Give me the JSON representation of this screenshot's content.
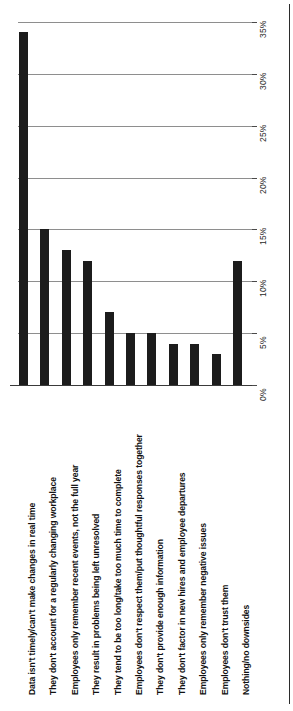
{
  "chart_data": {
    "type": "bar",
    "title": "",
    "subtitle": "",
    "xlabel": "",
    "ylabel": "",
    "orientation": "vertical-bars-rotated-labels",
    "grid": true,
    "legend": false,
    "ylim": [
      0,
      35
    ],
    "ytick_labels": [
      "0%",
      "5%",
      "10%",
      "15%",
      "20%",
      "25%",
      "30%",
      "35%"
    ],
    "ytick_values": [
      0,
      5,
      10,
      15,
      20,
      25,
      30,
      35
    ],
    "categories": [
      "Data isn't timely/can't make changes in real time",
      "They don't account for a regularly changing workplace",
      "Employees only remember recent events, not the full year",
      "They result in problems being left unresolved",
      "They tend to be too long/take too much time to complete",
      "Employees don't respect them/put thoughtful responses together",
      "They don't provide enough information",
      "They don't factor in new hires and employee departures",
      "Employees only remember negative issues",
      "Employees don't trust them",
      "Nothing/no downsides"
    ],
    "values": [
      34,
      15,
      13,
      12,
      7,
      5,
      5,
      4,
      4,
      3,
      12
    ],
    "bar_color": "#1c1c1c",
    "grid_color": "#8e8e8e",
    "background_color": "#ffffff"
  },
  "axis": {
    "unit": "%"
  }
}
